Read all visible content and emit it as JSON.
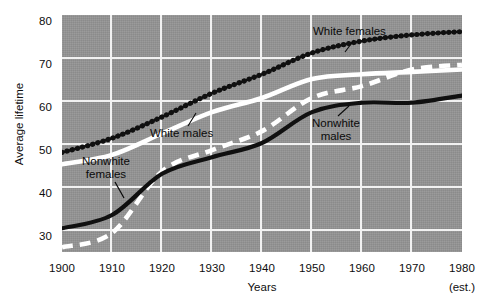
{
  "chart_data": {
    "type": "line",
    "title": "",
    "xlabel": "Years",
    "ylabel": "Average lifetime",
    "xlim": [
      1900,
      1980
    ],
    "ylim": [
      30,
      80
    ],
    "grid": true,
    "legend_position": "inline-annotations",
    "x_ticks": [
      "1900",
      "1910",
      "1920",
      "1930",
      "1940",
      "1950",
      "1960",
      "1970",
      "1980"
    ],
    "y_ticks": [
      "30",
      "40",
      "50",
      "60",
      "70",
      "80"
    ],
    "note": "(est.)",
    "x": [
      1900,
      1910,
      1920,
      1930,
      1940,
      1950,
      1960,
      1970,
      1980
    ],
    "series": [
      {
        "name": "White females",
        "style": "beaded-black",
        "color": "#101010",
        "values": [
          51.0,
          54.0,
          58.5,
          63.5,
          67.5,
          72.0,
          74.5,
          75.8,
          76.5
        ]
      },
      {
        "name": "White males",
        "style": "thick-white",
        "color": "#ffffff",
        "values": [
          48.5,
          50.5,
          55.0,
          59.5,
          62.5,
          66.5,
          67.5,
          68.0,
          68.5
        ]
      },
      {
        "name": "Nonwhite males",
        "style": "thick-black",
        "color": "#101010",
        "values": [
          35.0,
          37.8,
          46.5,
          50.0,
          53.0,
          59.5,
          61.5,
          61.5,
          63.0
        ]
      },
      {
        "name": "Nonwhite females",
        "style": "dashed-white",
        "color": "#ffffff",
        "values": [
          31.0,
          34.0,
          47.0,
          51.5,
          55.5,
          62.5,
          65.0,
          68.5,
          69.5
        ]
      }
    ],
    "annotations": [
      {
        "id": "white-females",
        "text": "White females",
        "lines": [
          "White females"
        ]
      },
      {
        "id": "white-males",
        "text": "White males",
        "lines": [
          "White males"
        ]
      },
      {
        "id": "nonwhite-males",
        "text": "Nonwhite males",
        "lines": [
          "Nonwhite",
          "males"
        ]
      },
      {
        "id": "nonwhite-females",
        "text": "Nonwhite females",
        "lines": [
          "Nonwhite",
          "females"
        ]
      }
    ],
    "colors": {
      "plot_background": "#949494",
      "gridline": "#f2f2f2",
      "page_background": "#ffffff",
      "text": "#0d0d0d"
    }
  }
}
